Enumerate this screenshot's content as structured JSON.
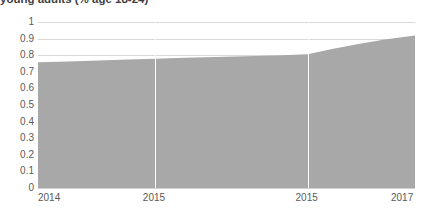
{
  "chart_data": {
    "type": "area",
    "title": "young adults (% age 18-24)",
    "xlabel": "",
    "ylabel": "",
    "ylim": [
      0,
      1
    ],
    "grid": true,
    "legend": null,
    "fill_color": "#a8a8a8",
    "gridline_color": "#d9d9d9",
    "vertical_gridline_color": "#ffffff",
    "axis_text_color": "#5a5a5a",
    "y_ticks": [
      "1",
      "0.9",
      "0.8",
      "0.7",
      "0.6",
      "0.5",
      "0.4",
      "0.3",
      "0.2",
      "0.1",
      "0"
    ],
    "y_tick_values": [
      1,
      0.9,
      0.8,
      0.7,
      0.6,
      0.5,
      0.4,
      0.3,
      0.2,
      0.1,
      0
    ],
    "x_ticks": [
      "2014",
      "2015",
      "2015",
      "2017"
    ],
    "x_tick_positions": [
      0,
      0.31,
      0.715,
      1
    ],
    "series": [
      {
        "name": "young adults",
        "x": [
          0.0,
          0.08,
          0.16,
          0.24,
          0.31,
          0.39,
          0.47,
          0.55,
          0.63,
          0.715,
          0.78,
          0.85,
          0.92,
          1.0
        ],
        "values": [
          0.757,
          0.762,
          0.768,
          0.774,
          0.779,
          0.784,
          0.789,
          0.793,
          0.798,
          0.805,
          0.838,
          0.868,
          0.895,
          0.918
        ]
      }
    ]
  },
  "axis": {
    "y_labels": [
      "1",
      "0.9",
      "0.8",
      "0.7",
      "0.6",
      "0.5",
      "0.4",
      "0.3",
      "0.2",
      "0.1",
      "0"
    ],
    "x_labels": [
      "2014",
      "2015",
      "2015",
      "2017"
    ]
  }
}
